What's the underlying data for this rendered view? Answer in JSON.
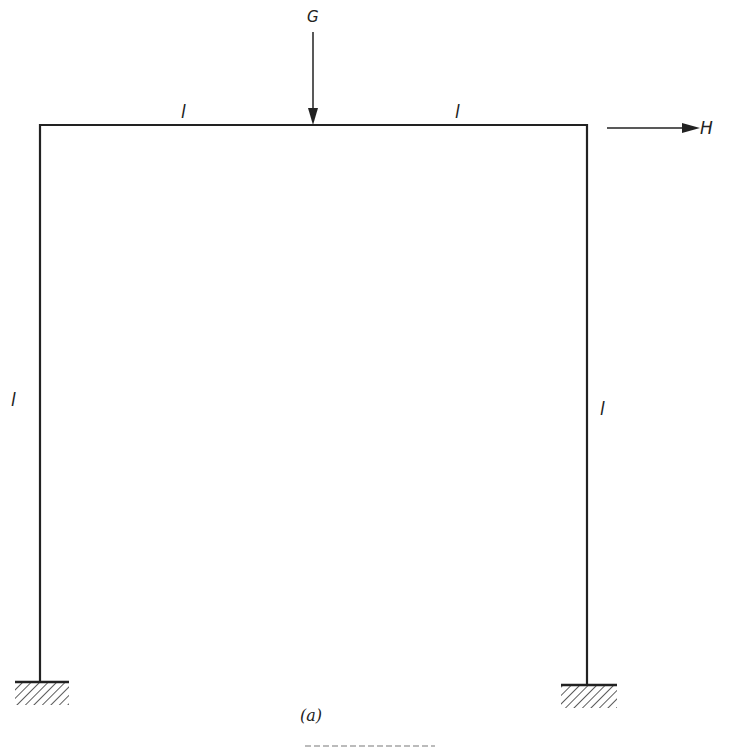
{
  "diagram": {
    "type": "portal-frame",
    "loads": {
      "vertical": {
        "label": "G",
        "direction": "down",
        "position": "midspan of beam"
      },
      "horizontal": {
        "label": "H",
        "direction": "right",
        "position": "top right corner"
      }
    },
    "dimensions": {
      "beam_left_half": "l",
      "beam_right_half": "l",
      "left_column": "l",
      "right_column": "l"
    },
    "supports": {
      "left": "fixed",
      "right": "fixed"
    },
    "caption": "(a)",
    "colors": {
      "line": "#222222",
      "background": "#ffffff"
    }
  }
}
